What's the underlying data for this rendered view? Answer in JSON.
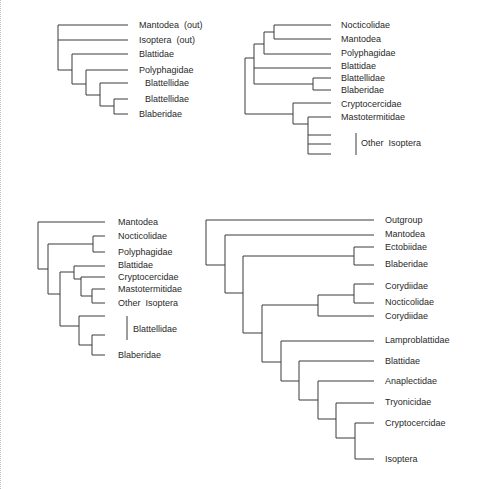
{
  "trees": [
    {
      "id": "tree-1",
      "labels": [
        "Mantodea  (out)",
        "Isoptera  (out)",
        "Blattidae",
        "Polyphagidae",
        "Blattellidae",
        "Blattellidae",
        "Blaberidae"
      ]
    },
    {
      "id": "tree-2",
      "labels": [
        "Nocticolidae",
        "Mantodea",
        "Polyphagidae",
        "Blattidae",
        "Blattellidae",
        "Blaberidae",
        "Cryptocercidae",
        "Mastotermitidae"
      ],
      "group_label": "Other  Isoptera"
    },
    {
      "id": "tree-3",
      "labels": [
        "Mantodea",
        "Nocticolidae",
        "Polyphagidae",
        "Blattidae",
        "Cryptocercidae",
        "Mastotermitidae",
        "Other  Isoptera",
        "Blaberidae"
      ],
      "group_label": "Blattellidae"
    },
    {
      "id": "tree-4",
      "labels": [
        "Outgroup",
        "Mantodea",
        "Ectobiidae",
        "Blaberidae",
        "Corydiidae",
        "Nocticolidae",
        "Corydiidae",
        "Lamproblattidae",
        "Blattidae",
        "Anaplectidae",
        "Tryonicidae",
        "Cryptocercidae",
        "Isoptera"
      ]
    }
  ],
  "colors": {
    "line": "#3a3a3a",
    "text": "#2a2a2a"
  }
}
